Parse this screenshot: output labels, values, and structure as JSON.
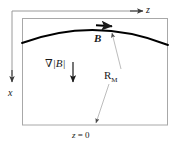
{
  "figure": {
    "colors": {
      "ink": "#1a1a1a",
      "box_border": "#9a9a9a",
      "axis": "#8a8a8a",
      "field_line": "#000000",
      "leader": "#b0b0b0",
      "background": "#ffffff"
    },
    "axes": {
      "z_label": "z",
      "x_label": "x",
      "z_direction": "right",
      "x_direction": "down",
      "origin_corner": "top-left"
    },
    "labels": {
      "field": "B",
      "gradient_nabla": "∇",
      "gradient_magnitude": "|B|",
      "gradient_full": "∇|B|",
      "radius": "R",
      "radius_subscript": "M",
      "radius_full": "R_M",
      "boundary": "z = 0",
      "boundary_var": "z",
      "boundary_rest": " = 0"
    },
    "geometry": {
      "box": {
        "x": 22,
        "y": 18,
        "width": 146,
        "height": 107
      },
      "field_line": {
        "start": [
          22,
          43
        ],
        "control": [
          95,
          16
        ],
        "end": [
          168,
          45
        ],
        "arrow_at": [
          110,
          27
        ],
        "arrow_direction": "right"
      },
      "gradient_arrow": {
        "x": 73,
        "y_start": 58,
        "y_end": 80,
        "direction": "down"
      },
      "radius_leader_upper": {
        "from": [
          120,
          68
        ],
        "to": [
          112,
          32
        ],
        "arrow": "up"
      },
      "radius_leader_lower": {
        "from": [
          110,
          82
        ],
        "to": [
          96,
          124
        ],
        "arrow": "down"
      },
      "z_axis_arrow": {
        "from": [
          22,
          10
        ],
        "to": [
          143,
          10
        ]
      },
      "x_axis_arrow": {
        "from": [
          12,
          10
        ],
        "to": [
          12,
          82
        ]
      }
    }
  }
}
